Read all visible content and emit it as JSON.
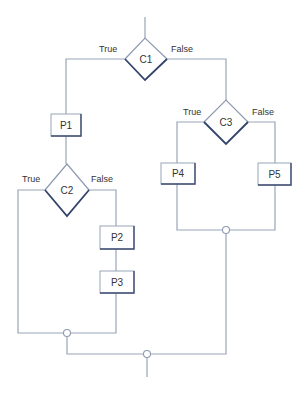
{
  "diagram": {
    "type": "flowchart",
    "decisions": [
      {
        "id": "c1",
        "label": "C1",
        "true_label": "True",
        "false_label": "False"
      },
      {
        "id": "c2",
        "label": "C2",
        "true_label": "True",
        "false_label": "False"
      },
      {
        "id": "c3",
        "label": "C3",
        "true_label": "True",
        "false_label": "False"
      }
    ],
    "processes": [
      {
        "id": "p1",
        "label": "P1"
      },
      {
        "id": "p2",
        "label": "P2"
      },
      {
        "id": "p3",
        "label": "P3"
      },
      {
        "id": "p4",
        "label": "P4"
      },
      {
        "id": "p5",
        "label": "P5"
      }
    ],
    "edges": [
      {
        "from": "start",
        "to": "c1"
      },
      {
        "from": "c1",
        "to": "p1",
        "label": "True"
      },
      {
        "from": "c1",
        "to": "c3",
        "label": "False"
      },
      {
        "from": "p1",
        "to": "c2"
      },
      {
        "from": "c2",
        "to": "join-c2",
        "label": "True"
      },
      {
        "from": "c2",
        "to": "p2",
        "label": "False"
      },
      {
        "from": "p2",
        "to": "p3"
      },
      {
        "from": "p3",
        "to": "join-c2"
      },
      {
        "from": "c3",
        "to": "p4",
        "label": "True"
      },
      {
        "from": "c3",
        "to": "p5",
        "label": "False"
      },
      {
        "from": "p4",
        "to": "join-c3"
      },
      {
        "from": "p5",
        "to": "join-c3"
      },
      {
        "from": "join-c2",
        "to": "join-c1"
      },
      {
        "from": "join-c3",
        "to": "join-c1"
      },
      {
        "from": "join-c1",
        "to": "end"
      }
    ]
  }
}
